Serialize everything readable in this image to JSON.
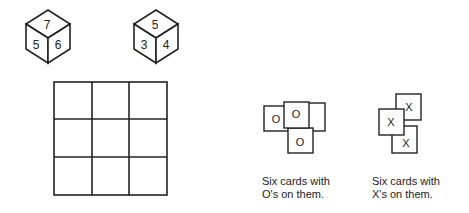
{
  "die_left": {
    "top": "7",
    "left": "5",
    "right": "6"
  },
  "die_right": {
    "top": "5",
    "left": "3",
    "right": "4"
  },
  "board": {
    "rows": 3,
    "cols": 3
  },
  "o_cards": {
    "symbols": [
      "O",
      "O",
      "O"
    ],
    "caption_line1": "Six cards with",
    "caption_line2": "O's on them."
  },
  "x_cards": {
    "symbols": [
      "X",
      "X",
      "X"
    ],
    "caption_line1": "Six cards with",
    "caption_line2": "X's on them."
  }
}
